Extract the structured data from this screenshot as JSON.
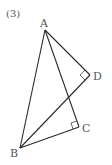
{
  "problem_label": "(3)",
  "points": {
    "A": {
      "label": "A",
      "x": 45,
      "y": 30,
      "lx": 40,
      "ly": 27
    },
    "B": {
      "label": "B",
      "x": 20,
      "y": 148,
      "lx": 10,
      "ly": 157
    },
    "C": {
      "label": "C",
      "x": 79,
      "y": 127,
      "lx": 82,
      "ly": 132
    },
    "D": {
      "label": "D",
      "x": 90,
      "y": 75,
      "lx": 93,
      "ly": 80
    }
  },
  "segments": [
    "AB",
    "AC",
    "AD",
    "BC",
    "BD"
  ],
  "right_angles": [
    "ADB",
    "ACB"
  ],
  "colors": {
    "line": "#2a2a2a",
    "label": "#555555"
  }
}
